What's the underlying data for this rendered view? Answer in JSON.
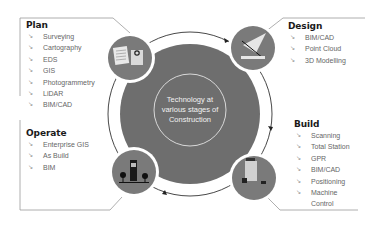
{
  "diagram": {
    "center_label": "Technology at various stages of Construction",
    "colors": {
      "disc": "#6e6e6e",
      "icon_circle": "#7a7a7a",
      "ring_line": "#333333",
      "frame_line": "#9a9a9a",
      "heading": "#1a1a1a",
      "item_text": "#666666"
    },
    "bullet_icon": "arrow-down-right-icon",
    "stages": [
      {
        "name": "Plan",
        "icon": "documents-magnifier-icon",
        "items": [
          "Surveying",
          "Cartography",
          "EDS",
          "GIS",
          "Photogrammetry",
          "LiDAR",
          "BIM/CAD"
        ]
      },
      {
        "name": "Design",
        "icon": "drafting-plane-icon",
        "items": [
          "BIM/CAD",
          "Point Cloud",
          "3D Modelling"
        ]
      },
      {
        "name": "Build",
        "icon": "construction-machinery-icon",
        "items": [
          "Scanning",
          "Total Station",
          "GPR",
          "BIM/CAD",
          "Positioning",
          "Machine Control"
        ]
      },
      {
        "name": "Operate",
        "icon": "building-trees-icon",
        "items": [
          "Enterprise GIS",
          "As Build",
          "BIM"
        ]
      }
    ]
  }
}
